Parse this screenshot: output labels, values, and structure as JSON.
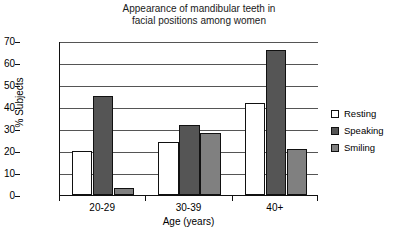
{
  "chart_data": {
    "type": "bar",
    "title": "Appearance of mandibular teeth in facial positions among women",
    "title_line1": "Appearance of mandibular teeth in",
    "title_line2": "facial positions among women",
    "xlabel": "Age (years)",
    "ylabel": "% Subjects",
    "categories": [
      "20-29",
      "30-39",
      "40+"
    ],
    "ylim": [
      0,
      70
    ],
    "yticks": [
      0,
      10,
      20,
      30,
      40,
      50,
      60,
      70
    ],
    "grid": true,
    "legend_position": "right",
    "series": [
      {
        "name": "Resting",
        "color": "#ffffff",
        "values": [
          20,
          24,
          42
        ]
      },
      {
        "name": "Speaking",
        "color": "#555555",
        "values": [
          45,
          32,
          66
        ]
      },
      {
        "name": "Smiling",
        "color": "#808080",
        "values": [
          3,
          28,
          21
        ]
      }
    ]
  }
}
